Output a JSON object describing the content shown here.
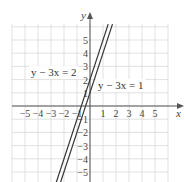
{
  "chart_data": {
    "type": "line",
    "title": "",
    "xlabel": "x",
    "ylabel": "y",
    "xlim": [
      -6,
      6
    ],
    "ylim": [
      -5.8,
      6.3
    ],
    "grid": true,
    "x_ticks": [
      -5,
      -4,
      -3,
      -2,
      -1,
      1,
      2,
      3,
      4,
      5
    ],
    "x_tick_labels": [
      "−5",
      "−4",
      "−3",
      "−2",
      "−1",
      "1",
      "2",
      "3",
      "4",
      "5"
    ],
    "y_ticks": [
      5,
      4,
      3,
      2,
      1,
      -1,
      -2,
      -3,
      -4,
      -5
    ],
    "y_tick_labels": [
      "5",
      "4",
      "3",
      "2",
      "1",
      "−1",
      "−2",
      "−3",
      "−4",
      "−5"
    ],
    "series": [
      {
        "name": "y − 3x = 2",
        "slope": 3,
        "intercept": 2,
        "x": [
          -2.6,
          1.4
        ],
        "y": [
          -5.8,
          6.2
        ]
      },
      {
        "name": "y − 3x = 1",
        "slope": 3,
        "intercept": 1,
        "x": [
          -2.27,
          1.73
        ],
        "y": [
          -5.8,
          6.2
        ]
      }
    ],
    "annotations": [
      {
        "text": "y − 3x = 2",
        "px": 31,
        "py": 76
      },
      {
        "text": "y − 3x = 1",
        "px": 98,
        "py": 89
      }
    ]
  },
  "layout": {
    "origin_px": [
      90,
      106
    ],
    "unit_x_px": 13,
    "unit_y_px": 13.2,
    "grid_x_range": [
      -6,
      6
    ],
    "grid_y_top": 6.2,
    "grid_y_bottom": -6,
    "x_axis_end_px": 184,
    "y_axis_top_px": 12
  },
  "colors": {
    "grid": "#d9d9d9",
    "axis": "#555555",
    "line": "#333333"
  }
}
